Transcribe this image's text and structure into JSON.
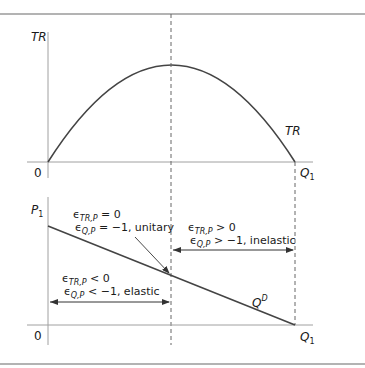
{
  "colors": {
    "rule": "#9a9a9a",
    "axis": "#a0a0a0",
    "curve": "#444444",
    "dashed": "#666666",
    "text": "#1a1a1a"
  },
  "top_panel": {
    "y_axis_label": "TR",
    "origin_label": "0",
    "x_axis_label_main": "Q",
    "x_axis_label_sub": "1",
    "curve_label": "TR"
  },
  "bottom_panel": {
    "y_axis_label_main": "P",
    "y_axis_label_sub": "1",
    "origin_label": "0",
    "x_axis_label_main": "Q",
    "x_axis_label_sub": "1",
    "curve_label_main": "Q",
    "curve_label_sup": "D",
    "unitary": {
      "line1_sub": "TR,P",
      "line1_rest": " = 0",
      "line2_sub": "Q,P",
      "line2_rest": " = −1, unitary"
    },
    "inelastic": {
      "line1_sub": "TR,P",
      "line1_rest": " > 0",
      "line2_sub": "Q,P",
      "line2_rest": " > −1, inelastic"
    },
    "elastic": {
      "line1_sub": "TR,P",
      "line1_rest": " < 0",
      "line2_sub": "Q,P",
      "line2_rest": " < −1, elastic"
    },
    "epsilon": "ϵ"
  }
}
